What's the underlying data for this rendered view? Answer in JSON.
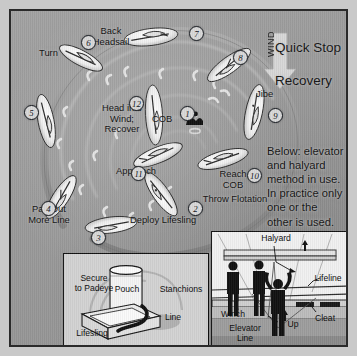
{
  "title": {
    "line1": "Quick Stop",
    "line2": "Recovery"
  },
  "wind": {
    "label": "WIND"
  },
  "note": "Below: elevator\nand halyard\nmethod in use.\nIn practice only\none or the\nother is used.",
  "center": {
    "cob_label": "COB"
  },
  "steps": [
    {
      "n": "1",
      "x": 169,
      "y": 95,
      "label": ""
    },
    {
      "n": "2",
      "x": 177,
      "y": 190,
      "label": "Deploy Lifesling"
    },
    {
      "n": "3",
      "x": 80,
      "y": 219,
      "label": ""
    },
    {
      "n": "4",
      "x": 30,
      "y": 190,
      "label": "Pay Out\nMore Line"
    },
    {
      "n": "5",
      "x": 13,
      "y": 94,
      "label": ""
    },
    {
      "n": "6",
      "x": 70,
      "y": 24,
      "label": "Turn"
    },
    {
      "n": "7",
      "x": 178,
      "y": 15,
      "label": "Back\nHeadsail"
    },
    {
      "n": "8",
      "x": 222,
      "y": 39,
      "label": ""
    },
    {
      "n": "9",
      "x": 257,
      "y": 97,
      "label": "Jibe"
    },
    {
      "n": "10",
      "x": 236,
      "y": 157,
      "label": "Reach\nCOB\nThrow Flotation"
    },
    {
      "n": "11",
      "x": 120,
      "y": 155,
      "label": "Approach"
    },
    {
      "n": "12",
      "x": 118,
      "y": 85,
      "label": "Head into\nWind;\nRecover"
    }
  ],
  "labels": {
    "turn": "Turn",
    "back_headsail": "Back\nHeadsail",
    "jibe": "Jibe",
    "reach_cob": "Reach\nCOB",
    "throw_flotation": "Throw Flotation",
    "approach": "Approach",
    "head_into_wind": "Head into\nWind;\nRecover",
    "deploy_lifesling": "Deploy Lifesling",
    "pay_out_more_line": "Pay Out\nMore Line"
  },
  "inset_left": {
    "secure_to_padeye": "Secure\nto Padeye",
    "pouch": "Pouch",
    "stanchions": "Stanchions",
    "line": "Line",
    "lifesling": "Lifesling"
  },
  "inset_right": {
    "halyard": "Halyard",
    "lifeline": "Lifeline",
    "winch": "Winch",
    "up": "Up",
    "cleat": "Cleat",
    "elevator_line": "Elevator\nLine"
  },
  "colors": {
    "sea": "#9a9a9a",
    "frame": "#2a2a2a",
    "outer": "#c9c9c9",
    "track": "#8c8c8c",
    "hull": "#f2f2f2",
    "text": "#111111"
  }
}
